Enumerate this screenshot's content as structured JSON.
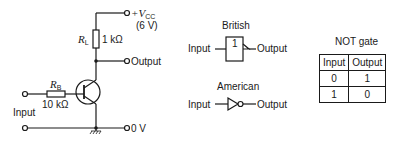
{
  "circuit": {
    "supply_label": "+V",
    "supply_sub": "CC",
    "supply_value": "(6 V)",
    "rl_label": "R",
    "rl_sub": "L",
    "rl_value": "1 kΩ",
    "rb_label": "R",
    "rb_sub": "B",
    "rb_value": "10 kΩ",
    "output_label": "Output",
    "input_label": "Input",
    "ground_label": "0 V"
  },
  "symbols": {
    "british": {
      "title": "British",
      "gate_text": "1",
      "input_label": "Input",
      "output_label": "Output"
    },
    "american": {
      "title": "American",
      "input_label": "Input",
      "output_label": "Output"
    }
  },
  "truth_table": {
    "title": "NOT gate",
    "headers": [
      "Input",
      "Output"
    ],
    "rows": [
      [
        "0",
        "1"
      ],
      [
        "1",
        "0"
      ]
    ]
  }
}
